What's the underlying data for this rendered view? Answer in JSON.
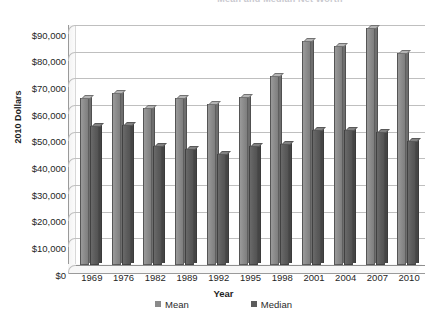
{
  "chart_data": {
    "type": "bar",
    "title": "Mean and Median Net Worth",
    "xlabel": "Year",
    "ylabel": "2010 Dollars",
    "categories": [
      "1969",
      "1976",
      "1982",
      "1989",
      "1992",
      "1995",
      "1998",
      "2001",
      "2004",
      "2007",
      "2010"
    ],
    "series": [
      {
        "name": "Mean",
        "color": "#8a8a8a",
        "values": [
          62500,
          64500,
          59000,
          62500,
          60500,
          63000,
          71000,
          84000,
          82000,
          89000,
          79500
        ]
      },
      {
        "name": "Median",
        "color": "#5c5c5c",
        "values": [
          52000,
          52500,
          44500,
          43500,
          41500,
          44500,
          45500,
          50500,
          50500,
          50000,
          46500
        ]
      }
    ],
    "ylim": [
      0,
      90000
    ],
    "ytick_step": 10000,
    "ytick_labels": [
      "$0",
      "$10,000",
      "$20,000",
      "$30,000",
      "$40,000",
      "$50,000",
      "$60,000",
      "$70,000",
      "$80,000",
      "$90,000"
    ],
    "grid": true,
    "legend_position": "bottom",
    "legend_entries": [
      "Mean",
      "Median"
    ]
  }
}
